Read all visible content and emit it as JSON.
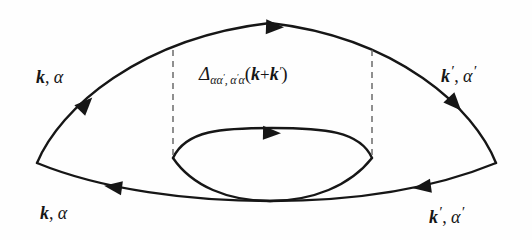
{
  "figure": {
    "type": "feynman-diagram",
    "background_color": "#fefefe",
    "line_color": "#161616",
    "dashed_line_color": "#6b6b6b",
    "width": 532,
    "height": 240
  },
  "labels": {
    "top_left": {
      "momentum": "k",
      "comma": ",",
      "spin": "α",
      "momentum_prime": "",
      "spin_prime": ""
    },
    "top_right": {
      "momentum": "k",
      "comma": ",",
      "spin": "α",
      "momentum_prime": "′",
      "spin_prime": "′"
    },
    "bottom_left": {
      "momentum": "k",
      "comma": ",",
      "spin": "α",
      "momentum_prime": "",
      "spin_prime": ""
    },
    "bottom_right": {
      "momentum": "k",
      "comma": ",",
      "spin": "α",
      "momentum_prime": "′",
      "spin_prime": "′"
    },
    "propagator": {
      "symbol": "Δ",
      "subscript_first": "αα",
      "subscript_first_prime": "′",
      "subscript_sep": ",",
      "subscript_second": "α",
      "subscript_second_prime": "′",
      "subscript_second_tail": "α",
      "open_paren": "(",
      "arg_k1": "k",
      "plus": "+",
      "arg_k2": "k",
      "arg_k2_prime": "′",
      "close_paren": ")",
      "full_text": "Δ_{αα′,α′α}(k+k′)"
    }
  },
  "geometry": {
    "left_vertex": {
      "x": 37,
      "y": 163
    },
    "right_vertex": {
      "x": 496,
      "y": 163
    },
    "crossing_point": {
      "x": 270,
      "y": 201
    },
    "loop_left_cusp": {
      "x": 173,
      "y": 158
    },
    "loop_right_cusp": {
      "x": 372,
      "y": 158
    },
    "outer_arc_apex": {
      "x": 270,
      "y": 22
    },
    "dashed_line_left_x": 173,
    "dashed_line_right_x": 372,
    "dashed_line_top_y": 50,
    "dashed_line_bottom_y": 158
  },
  "arrows": [
    {
      "id": "outer-top-arrow",
      "x": 275,
      "y": 27,
      "direction": "right",
      "rotation": 2
    },
    {
      "id": "upper-left-arrow",
      "x": 86,
      "y": 104,
      "direction": "up-right",
      "rotation": -46
    },
    {
      "id": "upper-right-arrow",
      "x": 455,
      "y": 104,
      "direction": "down-right",
      "rotation": 47
    },
    {
      "id": "loop-top-arrow",
      "x": 272,
      "y": 133,
      "direction": "right",
      "rotation": 1
    },
    {
      "id": "lower-left-arrow",
      "x": 113,
      "y": 187,
      "direction": "left",
      "rotation": 188
    },
    {
      "id": "lower-right-arrow",
      "x": 422,
      "y": 187,
      "direction": "left",
      "rotation": 172
    }
  ]
}
